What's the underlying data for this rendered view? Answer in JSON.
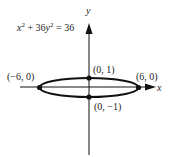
{
  "figure": {
    "equation": {
      "x_part": "x",
      "exp1": "2",
      "mid": " + 36",
      "y_part": "y",
      "exp2": "2",
      "rhs": " = 36"
    },
    "axes": {
      "x_label": "x",
      "y_label": "y"
    },
    "points": [
      {
        "label": "(−6, 0)",
        "x": -6,
        "y": 0
      },
      {
        "label": "(6, 0)",
        "x": 6,
        "y": 0
      },
      {
        "label": "(0, 1)",
        "x": 0,
        "y": 1
      },
      {
        "label": "(0, −1)",
        "x": 0,
        "y": -1
      }
    ],
    "colors": {
      "ink": "#111111",
      "background": "#ffffff"
    }
  }
}
